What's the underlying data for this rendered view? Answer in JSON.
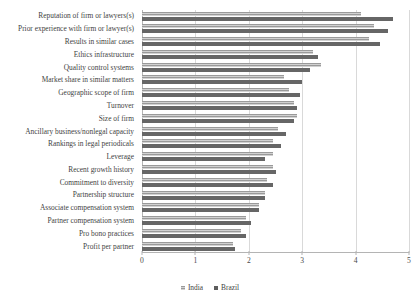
{
  "chart_data": {
    "type": "bar",
    "orientation": "horizontal",
    "title": "",
    "subtitle": "",
    "xlabel": "",
    "ylabel": "",
    "xlim": [
      0,
      5
    ],
    "xticks": [
      "0",
      "1",
      "2",
      "3",
      "4",
      "5"
    ],
    "grid": true,
    "legend_position": "bottom",
    "categories": [
      "Reputation of firm or lawyers(s)",
      "Prior experience with firm or lawyer(s)",
      "Results in similar cases",
      "Ethics infrastructure",
      "Quality control systems",
      "Market share in similar matters",
      "Geographic scope of firm",
      "Turnover",
      "Size of firm",
      "Ancillary business/nonlegal capacity",
      "Rankings in legal periodicals",
      "Leverage",
      "Recent growth history",
      "Commitment to diversity",
      "Partnership structure",
      "Associate compensation system",
      "Partner compensation system",
      "Pro bono practices",
      "Profit per partner"
    ],
    "series": [
      {
        "name": "India",
        "color": "#9a9a9a",
        "values": [
          4.1,
          4.35,
          4.25,
          3.2,
          3.35,
          2.65,
          2.75,
          2.85,
          2.9,
          2.55,
          2.45,
          2.45,
          2.45,
          2.35,
          2.3,
          2.2,
          1.95,
          1.85,
          1.7
        ]
      },
      {
        "name": "Brazil",
        "color": "#666666",
        "values": [
          4.7,
          4.6,
          4.45,
          3.3,
          3.15,
          3.0,
          2.95,
          2.9,
          2.85,
          2.7,
          2.6,
          2.3,
          2.5,
          2.45,
          2.3,
          2.2,
          2.05,
          1.95,
          1.75
        ]
      }
    ]
  },
  "legend": {
    "entries": [
      {
        "label": "India"
      },
      {
        "label": "Brazil"
      }
    ]
  }
}
